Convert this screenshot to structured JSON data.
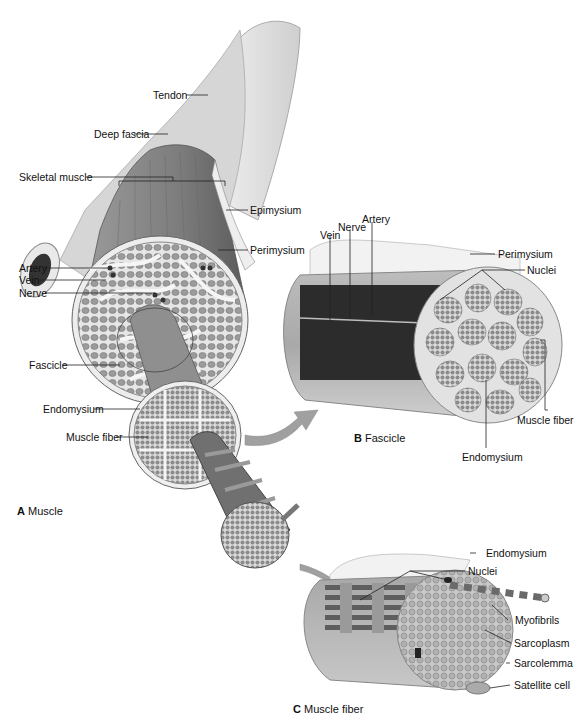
{
  "figure": {
    "panels": [
      {
        "id": "A",
        "letter": "A",
        "caption": "Muscle"
      },
      {
        "id": "B",
        "letter": "B",
        "caption": "Fascicle"
      },
      {
        "id": "C",
        "letter": "C",
        "caption": "Muscle fiber"
      }
    ]
  },
  "labels": {
    "A": {
      "tendon": "Tendon",
      "deep_fascia": "Deep fascia",
      "skeletal_muscle": "Skeletal muscle",
      "epimysium": "Epimysium",
      "perimysium": "Perimysium",
      "artery": "Artery",
      "vein": "Vein",
      "nerve": "Nerve",
      "fascicle": "Fascicle",
      "endomysium": "Endomysium",
      "muscle_fiber": "Muscle fiber"
    },
    "B": {
      "vein": "Vein",
      "nerve": "Nerve",
      "artery": "Artery",
      "perimysium": "Perimysium",
      "nuclei": "Nuclei",
      "muscle_fiber": "Muscle fiber",
      "endomysium": "Endomysium"
    },
    "C": {
      "endomysium": "Endomysium",
      "nuclei": "Nuclei",
      "myofibrils": "Myofibrils",
      "sarcoplasm": "Sarcoplasm",
      "sarcolemma": "Sarcolemma",
      "satellite_cell": "Satellite cell"
    }
  },
  "colors": {
    "background": "#ffffff",
    "bone": "#dcdcdc",
    "muscle": "#8a8a8a",
    "muscle_dark": "#5a5a5a",
    "connective": "#e8e8e8",
    "fascicle_fill": "#9a9a9a",
    "leader_line": "#222222"
  }
}
